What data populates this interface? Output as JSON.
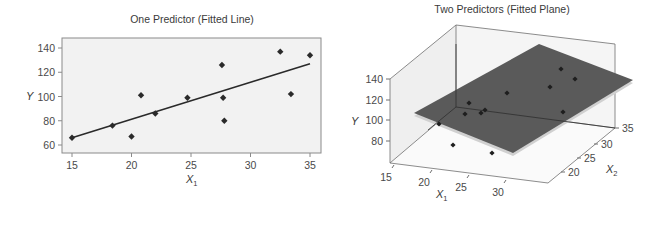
{
  "chart_data": [
    {
      "type": "scatter",
      "title": "One Predictor (Fitted Line)",
      "xlabel": "X",
      "xlabel_sub": "1",
      "ylabel": "Y",
      "xlim": [
        15,
        35
      ],
      "ylim": [
        56,
        146
      ],
      "xticks": [
        15,
        20,
        25,
        30,
        35
      ],
      "yticks": [
        60,
        80,
        100,
        120,
        140
      ],
      "grid": false,
      "points": [
        {
          "x": 15.0,
          "y": 66
        },
        {
          "x": 18.4,
          "y": 76
        },
        {
          "x": 20.0,
          "y": 67
        },
        {
          "x": 20.8,
          "y": 101
        },
        {
          "x": 22.0,
          "y": 86
        },
        {
          "x": 24.7,
          "y": 99
        },
        {
          "x": 27.6,
          "y": 126
        },
        {
          "x": 27.7,
          "y": 99
        },
        {
          "x": 27.8,
          "y": 80
        },
        {
          "x": 32.5,
          "y": 137
        },
        {
          "x": 33.4,
          "y": 102
        },
        {
          "x": 35.0,
          "y": 134
        }
      ],
      "fitted_line": {
        "x1": 15,
        "y1": 66,
        "x2": 35,
        "y2": 127
      },
      "colors": {
        "background": "#f2f2f2",
        "frame": "#8a8a8a",
        "points": "#2a2a2a",
        "line": "#2a2a2a"
      }
    },
    {
      "type": "scatter3d",
      "title": "Two Predictors (Fitted Plane)",
      "xlabel": "X",
      "xlabel_sub": "1",
      "ylabel": "Y",
      "zlabel": "X",
      "zlabel_sub": "2",
      "x1ticks": [
        15,
        20,
        25,
        30
      ],
      "x2ticks": [
        20,
        25,
        30,
        35
      ],
      "yticks": [
        80,
        100,
        120,
        140
      ],
      "surface": "fitted plane",
      "points_projected_px": [
        [
          439,
          124
        ],
        [
          453,
          145
        ],
        [
          465,
          114
        ],
        [
          469,
          103
        ],
        [
          481,
          113
        ],
        [
          485,
          110
        ],
        [
          492,
          153
        ],
        [
          507,
          93
        ],
        [
          550,
          87
        ],
        [
          561,
          69
        ],
        [
          563,
          112
        ],
        [
          575,
          79
        ]
      ],
      "colors": {
        "plane": "#5a5a5a",
        "plane_edge": "#bdbdbd",
        "box": "#6e6e6e",
        "wall": "#f3f3f3",
        "points": "#1e1e1e"
      }
    }
  ]
}
